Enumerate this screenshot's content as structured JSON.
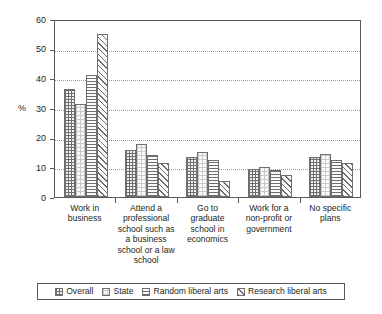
{
  "chart_data": {
    "type": "bar",
    "title": "",
    "subtitle": "",
    "xlabel": "",
    "ylabel": "%",
    "ylim": [
      0,
      60
    ],
    "yticks": [
      0,
      10,
      20,
      30,
      40,
      50,
      60
    ],
    "ytick_labels": [
      "0",
      "10",
      "20",
      "30",
      "40",
      "50",
      "60"
    ],
    "grid": true,
    "grid_axis": "y",
    "legend_position": "bottom",
    "categories": [
      "Work in business",
      "Attend a professional school such as a business school or a law school",
      "Go to graduate school in economics",
      "Work for a non-profit or government",
      "No specific plans"
    ],
    "category_lines": [
      [
        "Work in",
        "business"
      ],
      [
        "Attend a",
        "professional",
        "school such as",
        "a business",
        "school or a law",
        "school"
      ],
      [
        "Go to",
        "graduate",
        "school in",
        "economics"
      ],
      [
        "Work for a",
        "non-profit or",
        "government"
      ],
      [
        "No specific",
        "plans"
      ]
    ],
    "series": [
      {
        "name": "Overall",
        "pattern": "cross-hatch-dotted",
        "values": [
          36.3,
          16.0,
          13.6,
          9.6,
          13.6
        ]
      },
      {
        "name": "State",
        "pattern": "light-dotted",
        "values": [
          31.3,
          17.8,
          15.3,
          10.0,
          14.5
        ]
      },
      {
        "name": "Random liberal arts",
        "pattern": "horizontal-lines",
        "values": [
          41.1,
          14.3,
          12.4,
          9.2,
          12.5
        ]
      },
      {
        "name": "Research liberal arts",
        "pattern": "diagonal-hatch",
        "values": [
          55.1,
          11.5,
          5.4,
          7.5,
          11.4
        ]
      }
    ]
  },
  "legend": {
    "items": [
      {
        "label": "Overall"
      },
      {
        "label": "State"
      },
      {
        "label": "Random liberal arts"
      },
      {
        "label": "Research liberal arts"
      }
    ]
  },
  "colors": {
    "axis": "#58595b",
    "bar_outline": "#6d6e71",
    "grid": "#9a9a9a",
    "text": "#231f20",
    "background": "#ffffff"
  }
}
